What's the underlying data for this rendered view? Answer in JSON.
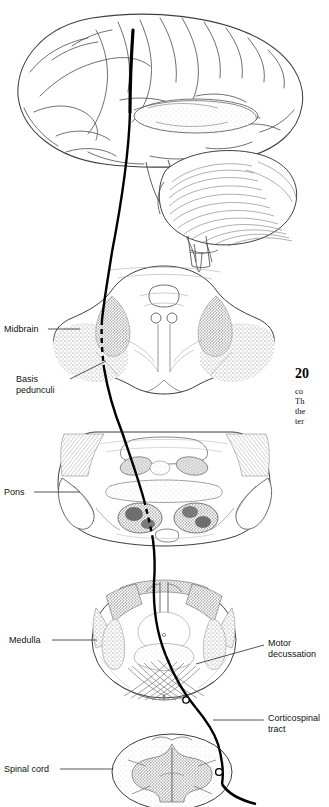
{
  "figure": {
    "labels_left": [
      {
        "name": "midbrain",
        "text": "Midbrain",
        "x": 4,
        "y": 324,
        "leader_x1": 48,
        "leader_y1": 329,
        "leader_x2": 80,
        "leader_y2": 329
      },
      {
        "name": "basis-pedunculi",
        "text_line1": "Basis",
        "text_line2": "pedunculi",
        "x": 16,
        "y": 374,
        "leader_x1": 70,
        "leader_y1": 379,
        "leader_x2": 106,
        "leader_y2": 361
      },
      {
        "name": "pons",
        "text": "Pons",
        "x": 4,
        "y": 487,
        "leader_x1": 34,
        "leader_y1": 492,
        "leader_x2": 80,
        "leader_y2": 492
      },
      {
        "name": "medulla",
        "text": "Medulla",
        "x": 9,
        "y": 635,
        "leader_x1": 52,
        "leader_y1": 640,
        "leader_x2": 97,
        "leader_y2": 640
      },
      {
        "name": "spinal-cord",
        "text": "Spinal cord",
        "x": 4,
        "y": 764,
        "leader_x1": 60,
        "leader_y1": 769,
        "leader_x2": 113,
        "leader_y2": 769
      }
    ],
    "labels_right": [
      {
        "name": "motor-decussation",
        "text_line1": "Motor",
        "text_line2": "decussation",
        "x": 268,
        "y": 638,
        "leader_x1": 264,
        "leader_y1": 645,
        "leader_x2": 196,
        "leader_y2": 664
      },
      {
        "name": "corticospinal-tract",
        "text_line1": "Corticospinal",
        "text_line2": "tract",
        "x": 268,
        "y": 713,
        "leader_x1": 264,
        "leader_y1": 720,
        "leader_x2": 213,
        "leader_y2": 720
      }
    ],
    "caption": {
      "number": "20",
      "lines": [
        "co",
        "Th",
        "the",
        "ter"
      ]
    },
    "colors": {
      "ink": "#3a3a3a",
      "tract": "#000000",
      "stipple": "#8a8a8a",
      "light": "#bfbfbf",
      "paper": "#ffffff"
    }
  }
}
